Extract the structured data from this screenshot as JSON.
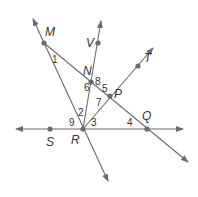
{
  "diagram": {
    "type": "geometry-lines-angles",
    "colors": {
      "line": "#6b6b6b",
      "text": "#333333",
      "background": "#ffffff"
    },
    "points": [
      {
        "id": "M",
        "label": "M",
        "x": 44,
        "y": 43,
        "lx": 45,
        "ly": 36
      },
      {
        "id": "V",
        "label": "V",
        "x": 98,
        "y": 43,
        "lx": 86,
        "ly": 47
      },
      {
        "id": "T",
        "label": "T",
        "x": 138,
        "y": 66,
        "lx": 144,
        "ly": 62
      },
      {
        "id": "N",
        "label": "N",
        "x": 91,
        "y": 82,
        "lx": 83,
        "ly": 75
      },
      {
        "id": "P",
        "label": "P",
        "x": 110,
        "y": 96,
        "lx": 114,
        "ly": 98
      },
      {
        "id": "S",
        "label": "S",
        "x": 50,
        "y": 129,
        "lx": 46,
        "ly": 146
      },
      {
        "id": "R",
        "label": "R",
        "x": 83,
        "y": 129,
        "lx": 71,
        "ly": 144
      },
      {
        "id": "Q",
        "label": "Q",
        "x": 147,
        "y": 129,
        "lx": 142,
        "ly": 120
      }
    ],
    "lines": [
      {
        "name": "line-SRQ",
        "x1": 16,
        "y1": 129,
        "x2": 183,
        "y2": 129,
        "arrow_start": true,
        "arrow_end": true
      },
      {
        "name": "line-MR",
        "x1": 33,
        "y1": 19,
        "x2": 108,
        "y2": 181,
        "arrow_start": true,
        "arrow_end": true
      },
      {
        "name": "line-RNV",
        "x1": 83,
        "y1": 129,
        "x2": 101,
        "y2": 21,
        "arrow_start": false,
        "arrow_end": true
      },
      {
        "name": "line-MNPQ",
        "x1": 44,
        "y1": 43,
        "x2": 188,
        "y2": 162,
        "arrow_start": false,
        "arrow_end": true
      },
      {
        "name": "line-RPT",
        "x1": 83,
        "y1": 129,
        "x2": 153,
        "y2": 48,
        "arrow_start": false,
        "arrow_end": true
      }
    ],
    "angles": [
      {
        "label": "1",
        "x": 52,
        "y": 63
      },
      {
        "label": "2",
        "x": 78,
        "y": 116
      },
      {
        "label": "3",
        "x": 91,
        "y": 126
      },
      {
        "label": "4",
        "x": 127,
        "y": 126
      },
      {
        "label": "5",
        "x": 102,
        "y": 92
      },
      {
        "label": "6",
        "x": 84,
        "y": 91
      },
      {
        "label": "7",
        "x": 96,
        "y": 106
      },
      {
        "label": "8",
        "x": 95,
        "y": 85
      },
      {
        "label": "9",
        "x": 69,
        "y": 126
      }
    ]
  }
}
